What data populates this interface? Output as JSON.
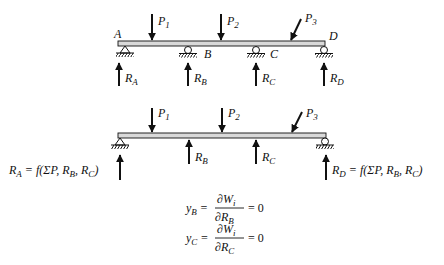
{
  "diagram": {
    "type": "continuous-beam-redundant-reactions",
    "top_beam": {
      "points": [
        "A",
        "B",
        "C",
        "D"
      ],
      "loads": [
        {
          "name": "P",
          "sub": "1"
        },
        {
          "name": "P",
          "sub": "2"
        },
        {
          "name": "P",
          "sub": "3"
        }
      ],
      "reactions": [
        {
          "name": "R",
          "sub": "A"
        },
        {
          "name": "R",
          "sub": "B"
        },
        {
          "name": "R",
          "sub": "C"
        },
        {
          "name": "R",
          "sub": "D"
        }
      ]
    },
    "bottom_beam": {
      "loads": [
        {
          "name": "P",
          "sub": "1"
        },
        {
          "name": "P",
          "sub": "2"
        },
        {
          "name": "P",
          "sub": "3"
        }
      ],
      "redundants": [
        {
          "name": "R",
          "sub": "B"
        },
        {
          "name": "R",
          "sub": "C"
        }
      ],
      "ra_expr": {
        "lhs": "R",
        "lhs_sub": "A",
        "rhs": " = f(ΣP, R",
        "s1": "B",
        "mid": ", R",
        "s2": "C",
        "end": ")"
      },
      "rd_expr": {
        "lhs": "R",
        "lhs_sub": "D",
        "rhs": " = f(ΣP, R",
        "s1": "B",
        "mid": ", R",
        "s2": "C",
        "end": ")"
      }
    },
    "equations": [
      {
        "lhs": "y",
        "lhs_sub": "B",
        "num": "∂W",
        "num_sub": "i",
        "den": "∂R",
        "den_sub": "B",
        "rhs": "= 0"
      },
      {
        "lhs": "y",
        "lhs_sub": "C",
        "num": "∂W",
        "num_sub": "i",
        "den": "∂R",
        "den_sub": "C",
        "rhs": "= 0"
      }
    ],
    "colors": {
      "beam_fill": "#d9d9d9",
      "stroke": "#111111"
    }
  }
}
